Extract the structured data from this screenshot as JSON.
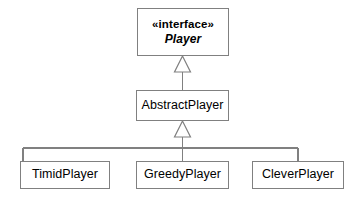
{
  "diagram": {
    "kind": "uml-class-diagram",
    "background_color": "#ffffff",
    "stroke_color": "#808080",
    "text_color": "#000000",
    "nodes": {
      "player": {
        "stereotype": "«interface»",
        "name": "Player"
      },
      "abstract_player": {
        "name": "AbstractPlayer"
      },
      "timid_player": {
        "name": "TimidPlayer"
      },
      "greedy_player": {
        "name": "GreedyPlayer"
      },
      "clever_player": {
        "name": "CleverPlayer"
      }
    },
    "relationships": [
      {
        "type": "generalization",
        "arrowhead": "hollow-triangle",
        "from": "AbstractPlayer",
        "to": "Player"
      },
      {
        "type": "generalization",
        "arrowhead": "hollow-triangle",
        "from": "TimidPlayer",
        "to": "AbstractPlayer"
      },
      {
        "type": "generalization",
        "arrowhead": "hollow-triangle",
        "from": "GreedyPlayer",
        "to": "AbstractPlayer"
      },
      {
        "type": "generalization",
        "arrowhead": "hollow-triangle",
        "from": "CleverPlayer",
        "to": "AbstractPlayer"
      }
    ]
  }
}
